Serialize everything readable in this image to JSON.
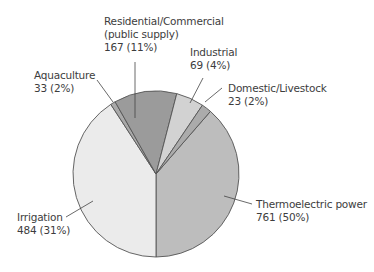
{
  "chart_data": {
    "type": "pie",
    "title": "",
    "slices": [
      {
        "label": "Thermoelectric power",
        "value": 761,
        "percent": "50%",
        "color": "#bdbdbd"
      },
      {
        "label": "Irrigation",
        "value": 484,
        "percent": "31%",
        "color": "#ebebeb"
      },
      {
        "label": "Aquaculture",
        "value": 33,
        "percent": "2%",
        "color": "#a9a9a9"
      },
      {
        "label": "Residential/Commercial (public supply)",
        "value": 167,
        "percent": "11%",
        "color": "#9b9b9b"
      },
      {
        "label": "Industrial",
        "value": 69,
        "percent": "4%",
        "color": "#d2d2d2"
      },
      {
        "label": "Domestic/Livestock",
        "value": 23,
        "percent": "2%",
        "color": "#ababab"
      }
    ],
    "legend": "none (direct labels)"
  },
  "labels": {
    "residential": {
      "line1": "Residential/Commercial",
      "line2": "(public supply)",
      "line3": "167 (11%)"
    },
    "industrial": {
      "line1": "Industrial",
      "line2": "69 (4%)"
    },
    "domestic": {
      "line1": "Domestic/Livestock",
      "line2": "23 (2%)"
    },
    "aquaculture": {
      "line1": "Aquaculture",
      "line2": "33 (2%)"
    },
    "irrigation": {
      "line1": "Irrigation",
      "line2": "484 (31%)"
    },
    "thermoelectric": {
      "line1": "Thermoelectric power",
      "line2": "761 (50%)"
    }
  }
}
